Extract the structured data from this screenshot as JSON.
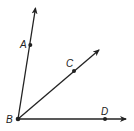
{
  "diagram": {
    "type": "angle-rays",
    "vertex": {
      "label": "B",
      "x": 18,
      "y": 119
    },
    "rays": [
      {
        "name": "BA",
        "point": {
          "label": "A",
          "x": 30,
          "y": 45
        },
        "tip": {
          "x": 36,
          "y": 5
        }
      },
      {
        "name": "BC",
        "point": {
          "label": "C",
          "x": 74,
          "y": 71
        },
        "tip": {
          "x": 101,
          "y": 48
        }
      },
      {
        "name": "BD",
        "point": {
          "label": "D",
          "x": 105,
          "y": 119
        },
        "tip": {
          "x": 129,
          "y": 119
        }
      }
    ],
    "colors": {
      "line": "#222222",
      "background": "#ffffff"
    }
  }
}
